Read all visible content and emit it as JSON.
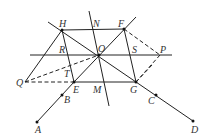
{
  "diagram": {
    "type": "geometry",
    "points": {
      "H": {
        "label": "H",
        "x": 62,
        "y": 30
      },
      "N": {
        "label": "N",
        "x": 92,
        "y": 29
      },
      "F": {
        "label": "F",
        "x": 124,
        "y": 29
      },
      "R": {
        "label": "R",
        "x": 65,
        "y": 55
      },
      "O": {
        "label": "O",
        "x": 99,
        "y": 55
      },
      "S": {
        "label": "S",
        "x": 134,
        "y": 55
      },
      "P": {
        "label": "P",
        "x": 160,
        "y": 55
      },
      "Q": {
        "label": "Q",
        "x": 25,
        "y": 82
      },
      "T": {
        "label": "T",
        "x": 68,
        "y": 72
      },
      "E": {
        "label": "E",
        "x": 74,
        "y": 82
      },
      "M": {
        "label": "M",
        "x": 100,
        "y": 82
      },
      "G": {
        "label": "G",
        "x": 136,
        "y": 82
      },
      "B": {
        "label": "B",
        "x": 62,
        "y": 95
      },
      "A": {
        "label": "A",
        "x": 37,
        "y": 122
      },
      "C": {
        "label": "C",
        "x": 156,
        "y": 95
      },
      "D": {
        "label": "D",
        "x": 193,
        "y": 121
      }
    },
    "labels": [
      "H",
      "N",
      "F",
      "R",
      "O",
      "S",
      "P",
      "Q",
      "T",
      "E",
      "M",
      "G",
      "B",
      "A",
      "C",
      "D"
    ]
  }
}
